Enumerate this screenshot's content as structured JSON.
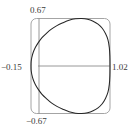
{
  "chart_data": {
    "type": "line",
    "title": "",
    "xlabel": "",
    "ylabel": "",
    "subtitle": "",
    "plot_kind": "polar-cardioid",
    "grid": false,
    "legend": null,
    "axis_lines": {
      "horizontal": true,
      "vertical": true,
      "horizontal_value": 0,
      "vertical_value": 0
    },
    "xlim": [
      -0.15,
      1.02
    ],
    "ylim": [
      -0.67,
      0.67
    ],
    "tick_labels": {
      "top": "0.67",
      "bottom": "−0.67",
      "left": "−0.15",
      "right": "1.02"
    },
    "extremes": {
      "x_min": -0.15,
      "x_max": 1.02,
      "y_min": -0.67,
      "y_max": 0.67
    },
    "curve": {
      "name": "cardioid",
      "equation": "r = a(1 + cosθ)",
      "cusp_at": [
        -0.15,
        0
      ],
      "rightmost_at": [
        1.02,
        0
      ],
      "topmost_y": 0.67,
      "bottommost_y": -0.67,
      "points": [
        [
          -0.15,
          0.0
        ],
        [
          -0.148,
          0.06
        ],
        [
          -0.138,
          0.12
        ],
        [
          -0.118,
          0.19
        ],
        [
          -0.086,
          0.26
        ],
        [
          -0.042,
          0.33
        ],
        [
          0.013,
          0.4
        ],
        [
          0.078,
          0.46
        ],
        [
          0.152,
          0.52
        ],
        [
          0.234,
          0.57
        ],
        [
          0.322,
          0.61
        ],
        [
          0.414,
          0.645
        ],
        [
          0.508,
          0.665
        ],
        [
          0.6,
          0.67
        ],
        [
          0.688,
          0.66
        ],
        [
          0.77,
          0.632
        ],
        [
          0.843,
          0.59
        ],
        [
          0.905,
          0.532
        ],
        [
          0.953,
          0.458
        ],
        [
          0.99,
          0.37
        ],
        [
          1.01,
          0.26
        ],
        [
          1.018,
          0.14
        ],
        [
          1.02,
          0.0
        ],
        [
          1.018,
          -0.14
        ],
        [
          1.01,
          -0.26
        ],
        [
          0.99,
          -0.37
        ],
        [
          0.953,
          -0.458
        ],
        [
          0.905,
          -0.532
        ],
        [
          0.843,
          -0.59
        ],
        [
          0.77,
          -0.632
        ],
        [
          0.688,
          -0.66
        ],
        [
          0.6,
          -0.67
        ],
        [
          0.508,
          -0.665
        ],
        [
          0.414,
          -0.645
        ],
        [
          0.322,
          -0.61
        ],
        [
          0.234,
          -0.57
        ],
        [
          0.152,
          -0.52
        ],
        [
          0.078,
          -0.46
        ],
        [
          0.013,
          -0.4
        ],
        [
          -0.042,
          -0.33
        ],
        [
          -0.086,
          -0.26
        ],
        [
          -0.118,
          -0.19
        ],
        [
          -0.138,
          -0.12
        ],
        [
          -0.148,
          -0.06
        ],
        [
          -0.15,
          0.0
        ]
      ]
    },
    "colors": {
      "curve": "#262626",
      "frame": "#9a9a9a",
      "axis": "#8c8c8c",
      "text": "#3a3a3a",
      "background": "#ffffff"
    }
  }
}
